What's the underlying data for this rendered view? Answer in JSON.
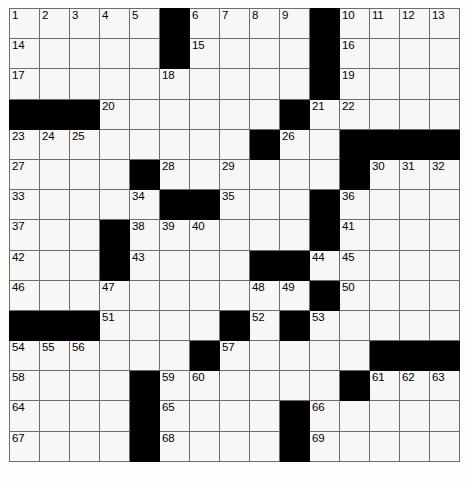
{
  "puzzle": {
    "type": "crossword-grid",
    "title": "Crossword Puzzle Grid",
    "columns": 15,
    "rows": 15,
    "colors": {
      "block": "#000000",
      "cell": "#f7f7f5",
      "gridline": "#6d6d6d",
      "number": "#000000",
      "background": "#ffffff"
    },
    "legend": {
      "block_symbol": "#",
      "open_symbol": "."
    },
    "layout": [
      "....._...._....",
      "....._...._....",
      "....._...._....",
      "###......#.....",
      "........#..####",
      "...._.._......_",
      "...._##...._...",
      "..._....._.####",
      "..._.....##....",
      "..._......_....",
      "###...._._.....",
      "......#.....###",
      "...._........._",
      "...._....#.....",
      "...._....#....."
    ],
    "numbers": [
      {
        "row": 0,
        "col": 0,
        "n": "1"
      },
      {
        "row": 0,
        "col": 1,
        "n": "2"
      },
      {
        "row": 0,
        "col": 2,
        "n": "3"
      },
      {
        "row": 0,
        "col": 3,
        "n": "4"
      },
      {
        "row": 0,
        "col": 4,
        "n": "5"
      },
      {
        "row": 0,
        "col": 6,
        "n": "6"
      },
      {
        "row": 0,
        "col": 7,
        "n": "7"
      },
      {
        "row": 0,
        "col": 8,
        "n": "8"
      },
      {
        "row": 0,
        "col": 9,
        "n": "9"
      },
      {
        "row": 0,
        "col": 11,
        "n": "10"
      },
      {
        "row": 0,
        "col": 12,
        "n": "11"
      },
      {
        "row": 0,
        "col": 13,
        "n": "12"
      },
      {
        "row": 0,
        "col": 14,
        "n": "13"
      },
      {
        "row": 1,
        "col": 0,
        "n": "14"
      },
      {
        "row": 1,
        "col": 6,
        "n": "15"
      },
      {
        "row": 1,
        "col": 11,
        "n": "16"
      },
      {
        "row": 2,
        "col": 0,
        "n": "17"
      },
      {
        "row": 2,
        "col": 5,
        "n": "18"
      },
      {
        "row": 2,
        "col": 11,
        "n": "19"
      },
      {
        "row": 3,
        "col": 3,
        "n": "20"
      },
      {
        "row": 3,
        "col": 10,
        "n": "21"
      },
      {
        "row": 3,
        "col": 11,
        "n": "22"
      },
      {
        "row": 4,
        "col": 0,
        "n": "23"
      },
      {
        "row": 4,
        "col": 1,
        "n": "24"
      },
      {
        "row": 4,
        "col": 2,
        "n": "25"
      },
      {
        "row": 4,
        "col": 9,
        "n": "26"
      },
      {
        "row": 5,
        "col": 0,
        "n": "27"
      },
      {
        "row": 5,
        "col": 5,
        "n": "28"
      },
      {
        "row": 5,
        "col": 7,
        "n": "29"
      },
      {
        "row": 5,
        "col": 12,
        "n": "30"
      },
      {
        "row": 5,
        "col": 13,
        "n": "31"
      },
      {
        "row": 5,
        "col": 14,
        "n": "32"
      },
      {
        "row": 6,
        "col": 0,
        "n": "33"
      },
      {
        "row": 6,
        "col": 4,
        "n": "34"
      },
      {
        "row": 6,
        "col": 7,
        "n": "35"
      },
      {
        "row": 6,
        "col": 11,
        "n": "36"
      },
      {
        "row": 7,
        "col": 0,
        "n": "37"
      },
      {
        "row": 7,
        "col": 4,
        "n": "38"
      },
      {
        "row": 7,
        "col": 5,
        "n": "39"
      },
      {
        "row": 7,
        "col": 6,
        "n": "40"
      },
      {
        "row": 7,
        "col": 11,
        "n": "41"
      },
      {
        "row": 8,
        "col": 0,
        "n": "42"
      },
      {
        "row": 8,
        "col": 4,
        "n": "43"
      },
      {
        "row": 8,
        "col": 10,
        "n": "44"
      },
      {
        "row": 8,
        "col": 11,
        "n": "45"
      },
      {
        "row": 9,
        "col": 0,
        "n": "46"
      },
      {
        "row": 9,
        "col": 3,
        "n": "47"
      },
      {
        "row": 9,
        "col": 8,
        "n": "48"
      },
      {
        "row": 9,
        "col": 9,
        "n": "49"
      },
      {
        "row": 9,
        "col": 11,
        "n": "50"
      },
      {
        "row": 10,
        "col": 3,
        "n": "51"
      },
      {
        "row": 10,
        "col": 8,
        "n": "52"
      },
      {
        "row": 10,
        "col": 10,
        "n": "53"
      },
      {
        "row": 11,
        "col": 0,
        "n": "54"
      },
      {
        "row": 11,
        "col": 1,
        "n": "55"
      },
      {
        "row": 11,
        "col": 2,
        "n": "56"
      },
      {
        "row": 11,
        "col": 7,
        "n": "57"
      },
      {
        "row": 12,
        "col": 0,
        "n": "58"
      },
      {
        "row": 12,
        "col": 5,
        "n": "59"
      },
      {
        "row": 12,
        "col": 6,
        "n": "60"
      },
      {
        "row": 12,
        "col": 12,
        "n": "61"
      },
      {
        "row": 12,
        "col": 13,
        "n": "62"
      },
      {
        "row": 12,
        "col": 14,
        "n": "63"
      },
      {
        "row": 13,
        "col": 0,
        "n": "64"
      },
      {
        "row": 13,
        "col": 5,
        "n": "65"
      },
      {
        "row": 13,
        "col": 10,
        "n": "66"
      },
      {
        "row": 14,
        "col": 0,
        "n": "67"
      },
      {
        "row": 14,
        "col": 5,
        "n": "68"
      },
      {
        "row": 14,
        "col": 10,
        "n": "69"
      }
    ],
    "blocks": [
      {
        "row": 0,
        "col": 5
      },
      {
        "row": 0,
        "col": 10
      },
      {
        "row": 1,
        "col": 5
      },
      {
        "row": 1,
        "col": 10
      },
      {
        "row": 2,
        "col": 10
      },
      {
        "row": 3,
        "col": 0
      },
      {
        "row": 3,
        "col": 1
      },
      {
        "row": 3,
        "col": 2
      },
      {
        "row": 3,
        "col": 9
      },
      {
        "row": 4,
        "col": 8
      },
      {
        "row": 4,
        "col": 11
      },
      {
        "row": 4,
        "col": 12
      },
      {
        "row": 4,
        "col": 13
      },
      {
        "row": 4,
        "col": 14
      },
      {
        "row": 5,
        "col": 4
      },
      {
        "row": 5,
        "col": 11
      },
      {
        "row": 6,
        "col": 5
      },
      {
        "row": 6,
        "col": 6
      },
      {
        "row": 6,
        "col": 10
      },
      {
        "row": 7,
        "col": 3
      },
      {
        "row": 7,
        "col": 10
      },
      {
        "row": 8,
        "col": 3
      },
      {
        "row": 8,
        "col": 8
      },
      {
        "row": 8,
        "col": 9
      },
      {
        "row": 9,
        "col": 10
      },
      {
        "row": 10,
        "col": 0
      },
      {
        "row": 10,
        "col": 1
      },
      {
        "row": 10,
        "col": 2
      },
      {
        "row": 10,
        "col": 7
      },
      {
        "row": 10,
        "col": 9
      },
      {
        "row": 11,
        "col": 6
      },
      {
        "row": 11,
        "col": 12
      },
      {
        "row": 11,
        "col": 13
      },
      {
        "row": 11,
        "col": 14
      },
      {
        "row": 12,
        "col": 4
      },
      {
        "row": 12,
        "col": 11
      },
      {
        "row": 13,
        "col": 4
      },
      {
        "row": 13,
        "col": 9
      },
      {
        "row": 14,
        "col": 4
      },
      {
        "row": 14,
        "col": 9
      }
    ]
  }
}
